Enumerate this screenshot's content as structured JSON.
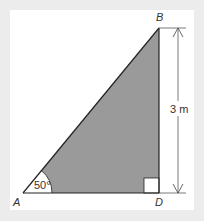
{
  "diagram": {
    "type": "right-triangle",
    "vertices": {
      "A": {
        "label": "A"
      },
      "B": {
        "label": "B"
      },
      "D": {
        "label": "D"
      }
    },
    "angle_A": {
      "label": "50°"
    },
    "side_BD": {
      "label": "3 m"
    },
    "right_angle_at": "D",
    "colors": {
      "background": "#ececec",
      "panel": "#ffffff",
      "fill": "#9a9a9a",
      "stroke": "#222222",
      "dimension": "#333333"
    }
  }
}
